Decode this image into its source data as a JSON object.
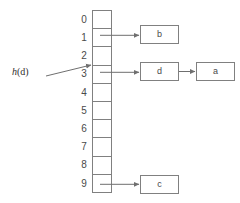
{
  "diagram": {
    "colors": {
      "stroke": "#808080",
      "text": "#4a4a4a",
      "annotation_text": "#2e2e2e",
      "background": "#ffffff"
    },
    "table": {
      "name": "hash-table-array",
      "slot_count": 10,
      "slots": [
        {
          "index": "0",
          "has_chain": false
        },
        {
          "index": "1",
          "has_chain": true
        },
        {
          "index": "2",
          "has_chain": false
        },
        {
          "index": "3",
          "has_chain": true
        },
        {
          "index": "4",
          "has_chain": false
        },
        {
          "index": "5",
          "has_chain": false
        },
        {
          "index": "6",
          "has_chain": false
        },
        {
          "index": "7",
          "has_chain": false
        },
        {
          "index": "8",
          "has_chain": false
        },
        {
          "index": "9",
          "has_chain": true
        }
      ]
    },
    "chains": [
      {
        "slot": "1",
        "nodes": [
          {
            "label": "b"
          }
        ]
      },
      {
        "slot": "3",
        "nodes": [
          {
            "label": "d"
          },
          {
            "label": "a"
          }
        ]
      },
      {
        "slot": "9",
        "nodes": [
          {
            "label": "c"
          }
        ]
      }
    ],
    "annotation": {
      "name": "hash-function-pointer",
      "function": "h",
      "argument": "(d)",
      "points_to_slot": "3"
    }
  }
}
